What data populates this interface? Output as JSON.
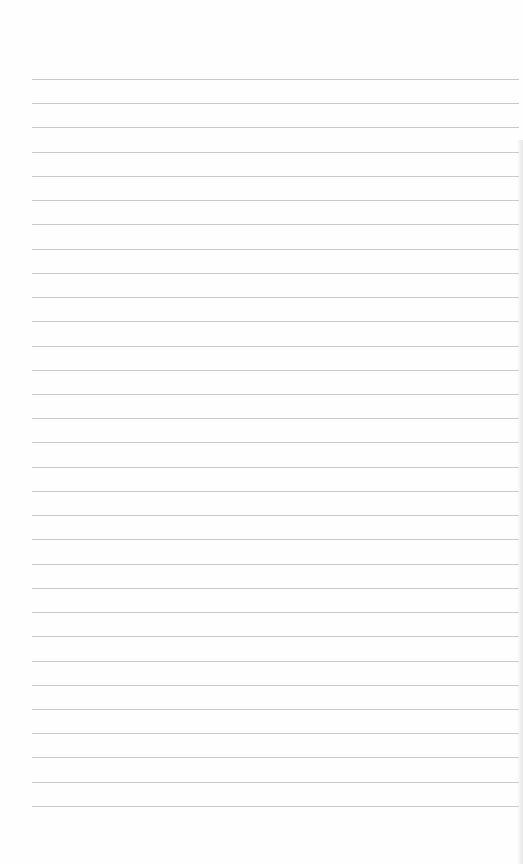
{
  "page": {
    "type": "blank lined paper",
    "rule_count": 31,
    "first_rule_y": 79,
    "rule_spacing": 24.23,
    "rule_left": 32,
    "rule_width": 487,
    "rule_color": "#c9c9c9",
    "paper_color": "#fefefe"
  }
}
